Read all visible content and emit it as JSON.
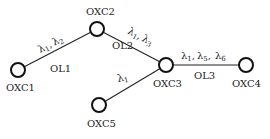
{
  "diagram": {
    "type": "optical network topology",
    "nodes": [
      {
        "id": "OXC1",
        "label": "OXC1"
      },
      {
        "id": "OXC2",
        "label": "OXC2"
      },
      {
        "id": "OXC3",
        "label": "OXC3"
      },
      {
        "id": "OXC4",
        "label": "OXC4"
      },
      {
        "id": "OXC5",
        "label": "OXC5"
      }
    ],
    "links": [
      {
        "id": "OL1",
        "label": "OL1",
        "from": "OXC1",
        "to": "OXC2",
        "wavelengths": "λ1, λ2"
      },
      {
        "id": "OL2",
        "label": "OL2",
        "from": "OXC2",
        "to": "OXC3",
        "wavelengths": "λ1, λ3"
      },
      {
        "id": "OL3",
        "label": "OL3",
        "from": "OXC3",
        "to": "OXC4",
        "wavelengths": "λ1, λ5, λ6"
      },
      {
        "id": "OL4",
        "label": "",
        "from": "OXC5",
        "to": "OXC3",
        "wavelengths": "λ1"
      }
    ],
    "lambda_symbol": "λ",
    "comma": ",",
    "subs": {
      "ol1": [
        "1",
        "2"
      ],
      "ol2": [
        "1",
        "3"
      ],
      "ol3": [
        "1",
        "5",
        "6"
      ],
      "ol4": [
        "1"
      ]
    },
    "colors": {
      "line": "#222222",
      "node_fill": "#ffffff",
      "node_stroke": "#111111"
    }
  }
}
